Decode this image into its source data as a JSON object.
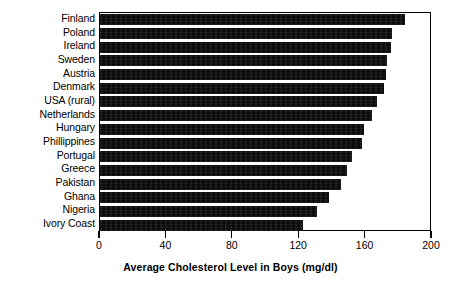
{
  "chart_data": {
    "type": "bar",
    "orientation": "horizontal",
    "title": "",
    "xlabel": "Average Cholesterol Level in Boys (mg/dl)",
    "ylabel": "",
    "xlim": [
      0,
      200
    ],
    "xticks": [
      0,
      40,
      80,
      120,
      160,
      200
    ],
    "grid": false,
    "legend": null,
    "bar_color": "#000000",
    "categories": [
      "Finland",
      "Poland",
      "Ireland",
      "Sweden",
      "Austria",
      "Denmark",
      "USA (rural)",
      "Netherlands",
      "Hungary",
      "Phillippines",
      "Portugal",
      "Greece",
      "Pakistan",
      "Ghana",
      "Nigeria",
      "Ivory Coast"
    ],
    "values": [
      184,
      176,
      175,
      173,
      172,
      171,
      167,
      164,
      159,
      158,
      152,
      149,
      145,
      138,
      131,
      122
    ]
  }
}
